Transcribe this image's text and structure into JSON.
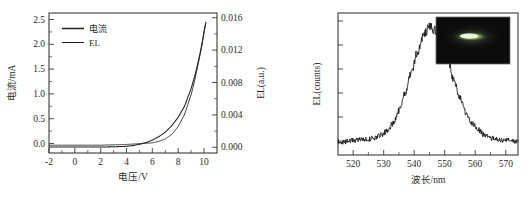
{
  "figure": {
    "background_color": "#ffffff",
    "foreground_color": "#242424"
  },
  "panel_left": {
    "name": "current-voltage-el-plot",
    "x_axis": {
      "title": "电压/V",
      "ticks": [
        "-2",
        "0",
        "2",
        "4",
        "6",
        "8",
        "10"
      ],
      "range": [
        -2,
        11
      ]
    },
    "y_axis_left": {
      "title": "电流/mA",
      "ticks": [
        "0.0",
        "0.5",
        "1.0",
        "1.5",
        "2.0",
        "2.5"
      ],
      "range": [
        -0.12,
        2.7
      ]
    },
    "y_axis_right": {
      "title": "EL(a.u.)",
      "ticks": [
        "0.000",
        "0.004",
        "0.008",
        "0.012",
        "0.016"
      ],
      "range": [
        -0.0007,
        0.01728
      ]
    },
    "legend": [
      {
        "label": "电流",
        "style": "thick"
      },
      {
        "label": "EL",
        "style": "thin"
      }
    ]
  },
  "panel_right": {
    "name": "el-spectrum-plot",
    "x_axis": {
      "title": "波长/nm",
      "ticks": [
        "520",
        "530",
        "540",
        "550",
        "560",
        "570"
      ],
      "range": [
        515,
        574
      ]
    },
    "y_axis": {
      "title": "EL(counts)"
    },
    "inset": {
      "name": "device-emission-photo",
      "background_color": "#0d0d0d",
      "emission_color": "#dff0c8",
      "description": "dark photograph with bright elongated green emission stripe"
    }
  },
  "chart_data": [
    {
      "type": "line",
      "title": "",
      "xlabel": "电压/V",
      "ylabel": "电流/mA",
      "y2label": "EL(a.u.)",
      "xlim": [
        -2,
        11
      ],
      "ylim": [
        -0.12,
        2.7
      ],
      "y2lim": [
        -0.0007,
        0.01728
      ],
      "grid": false,
      "legend_position": "upper-left",
      "series": [
        {
          "name": "电流",
          "axis": "left",
          "units": "mA",
          "x": [
            -2,
            -1,
            0,
            1,
            2,
            3,
            4,
            4.5,
            5,
            5.5,
            6,
            6.5,
            7,
            7.5,
            8,
            8.5,
            9,
            9.3,
            9.6,
            9.8,
            10,
            10.15
          ],
          "values": [
            0.0,
            0.0,
            0.0,
            0.0,
            0.0,
            0.005,
            0.015,
            0.03,
            0.055,
            0.09,
            0.14,
            0.21,
            0.3,
            0.43,
            0.6,
            0.83,
            1.18,
            1.45,
            1.78,
            2.03,
            2.33,
            2.52
          ]
        },
        {
          "name": "EL",
          "axis": "right",
          "units": "a.u.",
          "x": [
            -2,
            0,
            2,
            4,
            5,
            6,
            6.5,
            7,
            7.5,
            8,
            8.5,
            9,
            9.3,
            9.6,
            9.8,
            10,
            10.1
          ],
          "values": [
            0.0003,
            0.0003,
            0.0003,
            0.0004,
            0.0005,
            0.0006,
            0.0008,
            0.0011,
            0.0017,
            0.0027,
            0.0043,
            0.0068,
            0.0088,
            0.0112,
            0.0128,
            0.0148,
            0.0157
          ]
        }
      ]
    },
    {
      "type": "line",
      "title": "",
      "xlabel": "波长/nm",
      "ylabel": "EL(counts)",
      "xlim": [
        515,
        574
      ],
      "ylim": [
        0,
        1.08
      ],
      "grid": false,
      "peak_wavelength_nm": 545,
      "fwhm_nm": 21,
      "baseline_level": 0.1,
      "series": [
        {
          "name": "EL spectrum",
          "x": [
            515,
            517,
            519,
            521,
            523,
            525,
            527,
            529,
            531,
            533,
            535,
            537,
            539,
            541,
            543,
            545,
            547,
            549,
            551,
            553,
            555,
            557,
            559,
            561,
            563,
            565,
            567,
            569,
            571,
            573
          ],
          "values": [
            0.1,
            0.1,
            0.11,
            0.11,
            0.12,
            0.12,
            0.13,
            0.15,
            0.18,
            0.24,
            0.34,
            0.47,
            0.62,
            0.78,
            0.91,
            0.97,
            0.95,
            0.86,
            0.72,
            0.57,
            0.43,
            0.32,
            0.24,
            0.19,
            0.15,
            0.13,
            0.12,
            0.11,
            0.11,
            0.1
          ]
        }
      ]
    }
  ]
}
